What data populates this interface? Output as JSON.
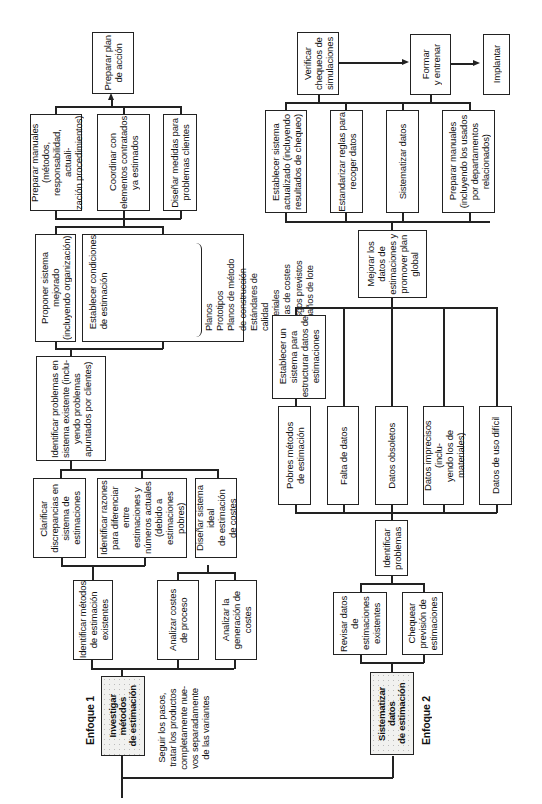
{
  "approach1": {
    "label": "Enfoque 1",
    "start": "Investigar\nmétodos\nde estimación",
    "note": "Seguir los pasos,\ntratar los productos\ncompletamente nue-\nvos separadamente\nde las variantes",
    "step1": [
      "Identificar métodos\nde estimación\nexistentes",
      "Analizar costes\nde proceso",
      "Analizar la\ngeneración de\ncostes"
    ],
    "step2": [
      "Clarificar\ndiscrepancias en\nsistema de\nestimaciones",
      "Identificar razones\npara diferenciar entre\nestimaciones y\nnúmeros actuales\n(debido a estimaciones\npobres)",
      "Diseñar sistema ideal\nde estimación\nde costes"
    ],
    "step3": "Identificar problemas en\nsistema existente (inclu-\nyendo problemas\napuntados por clientes)",
    "step4": {
      "propose": "Proponer sistema mejorado\n(incluyendo organización)",
      "conditions_title": "Establecer condiciones\nde estimación",
      "conditions_items": "Planos\nPrototipos\nPlanos de método\n    de construcción\nEstándares de calidad\nMateriales\nTablas de costes\nRiesgos previstos\nTamaños de lote"
    },
    "step5": [
      "Preparar manuales\n(métodos,\nresponsabilidad, actuali-\nzación procedimientos)",
      "Coordinar con\nelementos contratados\nya estimados",
      "Diseñar medidas para\nproblemas clientes"
    ],
    "final": "Preparar plan\nde acción"
  },
  "approach2": {
    "label": "Enfoque 2",
    "start": "Sistematizar datos\nde estimación",
    "step1": [
      "Revisar datos de\nestimaciones\nexistentes",
      "Chequear\nprevisión de\nestimaciones"
    ],
    "identify": "Identificar\nproblemas",
    "problems": [
      "Pobres métodos\nde estimación",
      "Falta de datos",
      "Datos obsoletos",
      "Datos imprecisos (inclu-\nyendo los de materiales)",
      "Datos de uso difícil"
    ],
    "establish": "Establecer un\nsistema para\nestructurar datos de\nestimaciones",
    "improve": "Mejorar los\ndatos de\nestimaciones y\npromover plan\nglobal",
    "step_top": [
      "Establecer sistema\nactualizado (incluyendo\nresultados de chequeo)",
      "Estandarizar reglas para\nrecoger datos",
      "Sistematizar datos",
      "Preparar manuales\n(incluyendo los usados\npor departamentos\nrelacionados)"
    ],
    "verify": "Verificar\nchequeos de\nsimulaciones",
    "train": "Formar\ny entrenar",
    "implement": "Implantar"
  }
}
